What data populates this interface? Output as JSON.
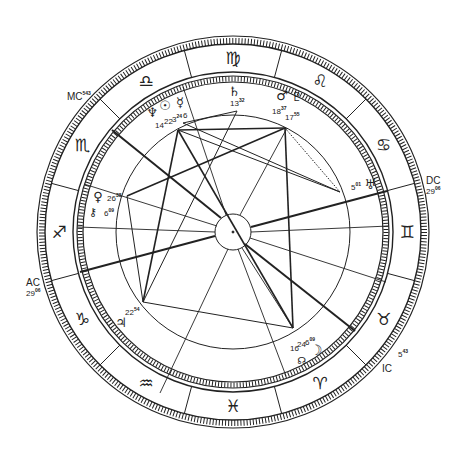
{
  "chart": {
    "type": "natal-horoscope-wheel",
    "center": [
      233,
      232
    ],
    "colors": {
      "ink": "#222222",
      "background": "#ffffff"
    }
  },
  "zodiac": [
    {
      "name": "Virgo",
      "glyph": "♍",
      "angle": -90
    },
    {
      "name": "Leo",
      "glyph": "♌",
      "angle": -60
    },
    {
      "name": "Cancer",
      "glyph": "♋",
      "angle": -30
    },
    {
      "name": "Gemini",
      "glyph": "♊",
      "angle": 0
    },
    {
      "name": "Taurus",
      "glyph": "♉",
      "angle": 30
    },
    {
      "name": "Aries",
      "glyph": "♈",
      "angle": 60
    },
    {
      "name": "Pisces",
      "glyph": "♓",
      "angle": 90
    },
    {
      "name": "Aquarius",
      "glyph": "♒",
      "angle": 120
    },
    {
      "name": "Capricorn",
      "glyph": "♑",
      "angle": 150
    },
    {
      "name": "Sagittarius",
      "glyph": "♐",
      "angle": 180
    },
    {
      "name": "Scorpio",
      "glyph": "♏",
      "angle": 210
    },
    {
      "name": "Libra",
      "glyph": "♎",
      "angle": 240
    }
  ],
  "axes": {
    "mc": {
      "label": "MC",
      "deg": "5",
      "min": "43"
    },
    "ic": {
      "label": "IC",
      "deg": "5",
      "min": "43"
    },
    "ac": {
      "label": "AC",
      "deg": "29",
      "min": "06"
    },
    "dc": {
      "label": "DC",
      "deg": "29",
      "min": "06"
    }
  },
  "planets": [
    {
      "name": "Saturn",
      "glyph": "♄",
      "deg": "13",
      "min": "32"
    },
    {
      "name": "Mars",
      "glyph": "♂",
      "deg": "18",
      "min": "37"
    },
    {
      "name": "Pluto",
      "glyph": "♇",
      "deg": "17",
      "min": "55"
    },
    {
      "name": "Neptune",
      "glyph": "♆",
      "deg": "14",
      "min": ""
    },
    {
      "name": "Sun",
      "glyph": "☉",
      "deg": "22",
      "min": ""
    },
    {
      "name": "Mercury",
      "glyph": "☿",
      "deg": "3",
      "min": "24"
    },
    {
      "name": "Mercury-2",
      "glyph": "",
      "deg": "6",
      "min": ""
    },
    {
      "name": "Venus",
      "glyph": "♀",
      "deg": "26",
      "min": "38"
    },
    {
      "name": "Chiron",
      "glyph": "⚷",
      "deg": "6",
      "min": "09"
    },
    {
      "name": "Uranus",
      "glyph": "♅",
      "deg": "5",
      "min": "01"
    },
    {
      "name": "Jupiter",
      "glyph": "♃",
      "deg": "22",
      "min": "54"
    },
    {
      "name": "Moon",
      "glyph": "☽",
      "deg": "16",
      "min": ""
    },
    {
      "name": "Moon-2",
      "glyph": "",
      "deg": "24",
      "min": ""
    },
    {
      "name": "Moon-3",
      "glyph": "",
      "deg": "6",
      "min": "09"
    },
    {
      "name": "North Node",
      "glyph": "☊",
      "deg": "",
      "min": ""
    }
  ]
}
